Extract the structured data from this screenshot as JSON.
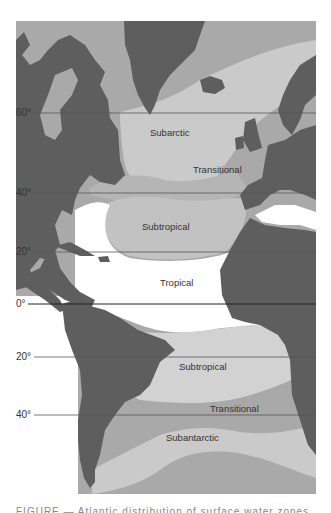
{
  "figure": {
    "type": "map",
    "colors": {
      "land": "#5e5e5e",
      "polar_transitional_water": "#a9a9a9",
      "subarctic_water": "#cacaca",
      "subtropical_water": "#c2c2c2",
      "tropical_water": "#ffffff",
      "latitude_line": "#555555"
    },
    "latitude_labels": [
      {
        "id": "lat-60n",
        "text": "60°"
      },
      {
        "id": "lat-40n",
        "text": "40°"
      },
      {
        "id": "lat-20n",
        "text": "20°"
      },
      {
        "id": "lat-0",
        "text": "0°"
      },
      {
        "id": "lat-20s",
        "text": "20°"
      },
      {
        "id": "lat-40s",
        "text": "40°"
      }
    ],
    "zones": [
      {
        "id": "subarctic",
        "label": "Subarctic"
      },
      {
        "id": "transitional-north",
        "label": "Transitional"
      },
      {
        "id": "subtropical-north",
        "label": "Subtropical"
      },
      {
        "id": "tropical",
        "label": "Tropical"
      },
      {
        "id": "subtropical-south",
        "label": "Subtropical"
      },
      {
        "id": "transitional-south",
        "label": "Transitional"
      },
      {
        "id": "subantarctic",
        "label": "Subantarctic"
      }
    ],
    "caption_partial": "FIGURE — Atlantic distribution of surface water zones (text cut off)"
  }
}
